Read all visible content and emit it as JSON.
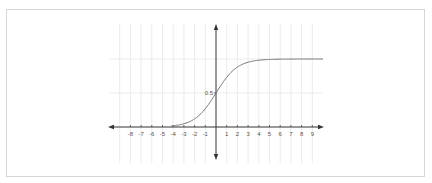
{
  "chart_data": {
    "type": "line",
    "title": "",
    "xlabel": "",
    "ylabel": "",
    "function": "sigmoid: 1/(1+e^-x)",
    "x_ticks": [
      -8,
      -7,
      -6,
      -5,
      -4,
      -3,
      -2,
      -1,
      1,
      2,
      3,
      4,
      5,
      6,
      7,
      8,
      9
    ],
    "y_ticks": [
      0.5
    ],
    "y_tick_labels": [
      "0.5"
    ],
    "xlim": [
      -10,
      10
    ],
    "ylim": [
      -0.45,
      1.5
    ],
    "grid": true,
    "legend": null,
    "series": [
      {
        "name": "sigmoid",
        "x": [
          -10,
          -8,
          -6,
          -5,
          -4,
          -3,
          -2,
          -1,
          0,
          1,
          2,
          3,
          4,
          5,
          6,
          8,
          10
        ],
        "y": [
          0.0,
          0.0003,
          0.0025,
          0.0067,
          0.018,
          0.047,
          0.119,
          0.269,
          0.5,
          0.731,
          0.881,
          0.953,
          0.982,
          0.993,
          0.9975,
          0.9997,
          1.0
        ],
        "color": "#777777"
      }
    ]
  },
  "style": {
    "axis_color": "#333333",
    "grid_color": "#e6e6e6",
    "curve_color": "#777777",
    "frame_color": "#d6d6d6"
  }
}
